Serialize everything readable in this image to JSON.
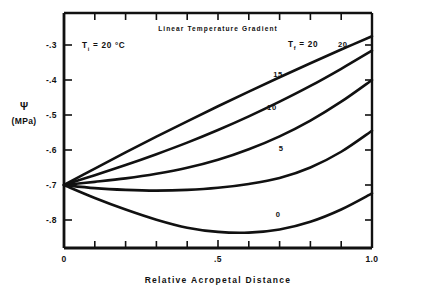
{
  "chart_data": {
    "type": "line",
    "title": "Linear Temperature Gradient",
    "xlabel": "Relative  Acropetal  Distance",
    "ylabel_symbol": "Ψ",
    "ylabel_unit": "(MPa)",
    "xlim": [
      0,
      1.0
    ],
    "ylim": [
      -0.87,
      -0.255
    ],
    "grid": false,
    "legend_position": "inline-curve-labels",
    "x_ticklabels": [
      "0",
      ".5",
      "1.0"
    ],
    "x_ticklabel_values": [
      0,
      0.5,
      1.0
    ],
    "x_minor_tick_values": [
      0.1,
      0.2,
      0.3,
      0.4,
      0.6,
      0.7,
      0.8,
      0.9
    ],
    "y_ticklabels": [
      "-.3",
      "-.4",
      "-.5",
      "-.6",
      "-.7",
      "-.8"
    ],
    "y_ticklabel_values": [
      -0.3,
      -0.4,
      -0.5,
      -0.6,
      -0.7,
      -0.8
    ],
    "annotations": [
      {
        "name": "initial-temperature",
        "text_prefix": "T",
        "text_subscript": "i",
        "text_suffix": " = 20 °C",
        "x": 0.09,
        "y": -0.315
      },
      {
        "name": "final-temperature-series-key",
        "text_prefix": "T",
        "text_subscript": "f",
        "text_suffix": " = 20",
        "x": 0.78,
        "y": -0.318
      }
    ],
    "series": [
      {
        "name": "Tf = 20",
        "label": "20",
        "label_x": 0.905,
        "label_y": -0.307,
        "x": [
          0.0,
          0.1,
          0.2,
          0.3,
          0.4,
          0.5,
          0.6,
          0.7,
          0.8,
          0.9,
          1.0
        ],
        "values": [
          -0.7,
          -0.653,
          -0.607,
          -0.562,
          -0.518,
          -0.475,
          -0.433,
          -0.392,
          -0.352,
          -0.313,
          -0.275
        ]
      },
      {
        "name": "Tf = 15",
        "label": "15",
        "label_x": 0.695,
        "label_y": -0.392,
        "x": [
          0.0,
          0.1,
          0.2,
          0.3,
          0.4,
          0.5,
          0.6,
          0.7,
          0.8,
          0.9,
          1.0
        ],
        "values": [
          -0.7,
          -0.672,
          -0.643,
          -0.612,
          -0.579,
          -0.543,
          -0.504,
          -0.462,
          -0.417,
          -0.368,
          -0.316
        ]
      },
      {
        "name": "Tf = 10",
        "label": "10",
        "label_x": 0.675,
        "label_y": -0.487,
        "x": [
          0.0,
          0.1,
          0.2,
          0.3,
          0.4,
          0.5,
          0.6,
          0.7,
          0.8,
          0.9,
          1.0
        ],
        "values": [
          -0.7,
          -0.691,
          -0.681,
          -0.668,
          -0.651,
          -0.628,
          -0.598,
          -0.561,
          -0.516,
          -0.462,
          -0.4
        ]
      },
      {
        "name": "Tf = 5",
        "label": "5",
        "label_x": 0.705,
        "label_y": -0.602,
        "x": [
          0.0,
          0.1,
          0.2,
          0.3,
          0.4,
          0.5,
          0.6,
          0.7,
          0.8,
          0.9,
          1.0
        ],
        "values": [
          -0.7,
          -0.709,
          -0.714,
          -0.716,
          -0.714,
          -0.708,
          -0.697,
          -0.68,
          -0.65,
          -0.605,
          -0.545
        ]
      },
      {
        "name": "Tf = 0",
        "label": "0",
        "label_x": 0.695,
        "label_y": -0.792,
        "x": [
          0.0,
          0.1,
          0.2,
          0.3,
          0.4,
          0.5,
          0.6,
          0.7,
          0.8,
          0.9,
          1.0
        ],
        "values": [
          -0.7,
          -0.737,
          -0.77,
          -0.799,
          -0.822,
          -0.834,
          -0.836,
          -0.827,
          -0.805,
          -0.77,
          -0.724
        ]
      }
    ]
  }
}
